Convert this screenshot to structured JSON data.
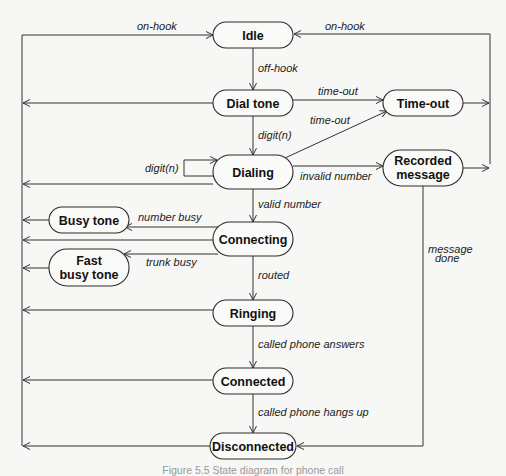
{
  "diagram": {
    "type": "state-diagram",
    "caption": "Figure 5.5 State diagram for phone call",
    "states": [
      {
        "id": "idle",
        "lines": [
          "Idle"
        ],
        "x": 213,
        "y": 22,
        "w": 80,
        "h": 26
      },
      {
        "id": "dial-tone",
        "lines": [
          "Dial tone"
        ],
        "x": 213,
        "y": 90,
        "w": 80,
        "h": 26
      },
      {
        "id": "time-out",
        "lines": [
          "Time-out"
        ],
        "x": 383,
        "y": 90,
        "w": 80,
        "h": 26
      },
      {
        "id": "dialing",
        "lines": [
          "Dialing"
        ],
        "x": 213,
        "y": 155,
        "w": 80,
        "h": 34
      },
      {
        "id": "recorded-message",
        "lines": [
          "Recorded",
          "message"
        ],
        "x": 383,
        "y": 150,
        "w": 80,
        "h": 36
      },
      {
        "id": "busy-tone",
        "lines": [
          "Busy tone"
        ],
        "x": 49,
        "y": 207,
        "w": 80,
        "h": 26
      },
      {
        "id": "connecting",
        "lines": [
          "Connecting"
        ],
        "x": 213,
        "y": 222,
        "w": 80,
        "h": 34
      },
      {
        "id": "fast-busy-tone",
        "lines": [
          "Fast",
          "busy tone"
        ],
        "x": 49,
        "y": 249,
        "w": 80,
        "h": 37
      },
      {
        "id": "ringing",
        "lines": [
          "Ringing"
        ],
        "x": 213,
        "y": 300,
        "w": 80,
        "h": 26
      },
      {
        "id": "connected",
        "lines": [
          "Connected"
        ],
        "x": 213,
        "y": 368,
        "w": 80,
        "h": 26
      },
      {
        "id": "disconnected",
        "lines": [
          "Disconnected"
        ],
        "x": 210,
        "y": 433,
        "w": 86,
        "h": 26
      }
    ],
    "transitions": [
      {
        "from": "idle",
        "to": "dial-tone",
        "label": "off-hook"
      },
      {
        "from": "dial-tone",
        "to": "dialing",
        "label": "digit(n)"
      },
      {
        "from": "dial-tone",
        "to": "time-out",
        "label": "time-out"
      },
      {
        "from": "dialing",
        "to": "time-out",
        "label": "time-out"
      },
      {
        "from": "dialing",
        "to": "dialing",
        "label": "digit(n)"
      },
      {
        "from": "dialing",
        "to": "recorded-message",
        "label": "invalid number"
      },
      {
        "from": "dialing",
        "to": "connecting",
        "label": "valid number"
      },
      {
        "from": "connecting",
        "to": "busy-tone",
        "label": "number busy"
      },
      {
        "from": "connecting",
        "to": "fast-busy-tone",
        "label": "trunk busy"
      },
      {
        "from": "connecting",
        "to": "ringing",
        "label": "routed"
      },
      {
        "from": "ringing",
        "to": "connected",
        "label": "called phone answers"
      },
      {
        "from": "connected",
        "to": "disconnected",
        "label": "called phone hangs up"
      },
      {
        "from": "recorded-message",
        "to": "disconnected",
        "label": "message done"
      },
      {
        "from": "time-out",
        "to": "idle",
        "label": "on-hook"
      },
      {
        "from": "*",
        "to": "idle",
        "label": "on-hook"
      }
    ],
    "labels": {
      "on_hook_left": "on-hook",
      "on_hook_right": "on-hook",
      "off_hook": "off-hook",
      "time_out_1": "time-out",
      "time_out_2": "time-out",
      "digit_n_down": "digit(n)",
      "digit_n_loop": "digit(n)",
      "invalid_number": "invalid number",
      "valid_number": "valid number",
      "number_busy": "number busy",
      "trunk_busy": "trunk busy",
      "routed": "routed",
      "message_done_1": "message",
      "message_done_2": "done",
      "called_answers": "called phone answers",
      "called_hangs_up": "called phone hangs up"
    }
  }
}
